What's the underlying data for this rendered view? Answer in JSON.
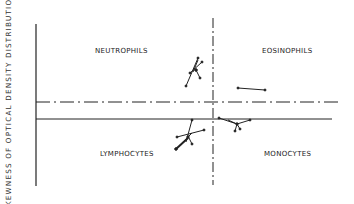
{
  "figure": {
    "y_axis_label": "SKEWNESS OF OPTICAL DENSITY DISTRIBUTION",
    "quadrants": {
      "top_left": "NEUTROPHILS",
      "top_right": "EOSINOPHILS",
      "bottom_left": "LYMPHOCYTES",
      "bottom_right": "MONOCYTES"
    },
    "lines": {
      "vertical_divider": "dash-dot",
      "upper_horizontal_divider": "dash-dot",
      "lower_horizontal_baseline": "solid"
    },
    "colors": {
      "ink": "#222222",
      "background": "#ffffff"
    }
  }
}
